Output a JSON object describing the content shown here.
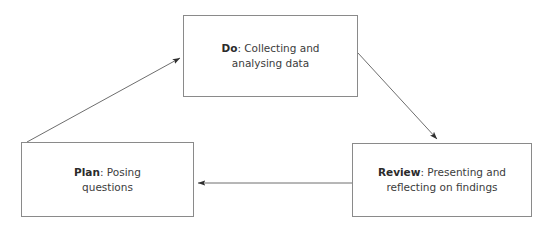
{
  "diagram": {
    "background_color": "#ffffff",
    "line_color": "#6e6e6e",
    "text_color": "#3c3c3c",
    "nodes": [
      {
        "id": "do",
        "keyword": "Do",
        "separator": ": ",
        "description": "Collecting and\nanalysing data",
        "full_text": "Do: Collecting and analysing data"
      },
      {
        "id": "plan",
        "keyword": "Plan",
        "separator": ": ",
        "description": "Posing\nquestions",
        "full_text": "Plan: Posing questions"
      },
      {
        "id": "review",
        "keyword": "Review",
        "separator": ": ",
        "description": "Presenting and\nreflecting on findings",
        "full_text": "Review: Presenting and reflecting on findings"
      }
    ],
    "edges": [
      {
        "id": "plan-to-do",
        "from": "plan",
        "to": "do",
        "direction": "diagonal-up-right",
        "arrowhead": "end"
      },
      {
        "id": "do-to-review",
        "from": "do",
        "to": "review",
        "direction": "diagonal-down-right",
        "arrowhead": "end"
      },
      {
        "id": "review-to-plan",
        "from": "review",
        "to": "plan",
        "direction": "horizontal-left",
        "arrowhead": "end"
      }
    ]
  }
}
